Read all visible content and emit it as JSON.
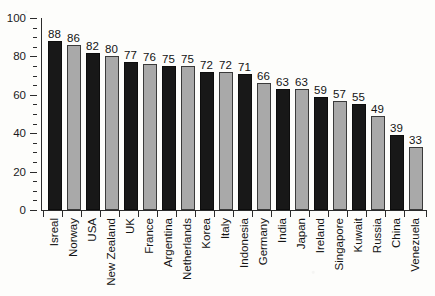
{
  "chart_data": {
    "type": "bar",
    "title": "",
    "subtitle": "",
    "xlabel": "",
    "ylabel": "",
    "ylim": [
      0,
      100
    ],
    "y_major_ticks": [
      0,
      20,
      40,
      60,
      80,
      100
    ],
    "y_minor_tick_step": 5,
    "grid": false,
    "legend": null,
    "bar_colors": {
      "dark": "#181818",
      "light": "#a9a9a9",
      "pattern": "alternating dark/light by index"
    },
    "value_labels_shown": true,
    "categories": [
      "Isreal",
      "Norway",
      "USA",
      "New Zealand",
      "UK",
      "France",
      "Argentina",
      "Netherlands",
      "Korea",
      "Italy",
      "Indonesia",
      "Germany",
      "India",
      "Japan",
      "Ireland",
      "Singapore",
      "Kuwait",
      "Russia",
      "China",
      "Venezuela"
    ],
    "values": [
      88,
      86,
      82,
      80,
      77,
      76,
      75,
      75,
      72,
      72,
      71,
      66,
      63,
      63,
      59,
      57,
      55,
      49,
      39,
      33
    ],
    "bars": [
      {
        "category": "Isreal",
        "value": 88,
        "shade": "dark"
      },
      {
        "category": "Norway",
        "value": 86,
        "shade": "light"
      },
      {
        "category": "USA",
        "value": 82,
        "shade": "dark"
      },
      {
        "category": "New Zealand",
        "value": 80,
        "shade": "light"
      },
      {
        "category": "UK",
        "value": 77,
        "shade": "dark"
      },
      {
        "category": "France",
        "value": 76,
        "shade": "light"
      },
      {
        "category": "Argentina",
        "value": 75,
        "shade": "dark"
      },
      {
        "category": "Netherlands",
        "value": 75,
        "shade": "light"
      },
      {
        "category": "Korea",
        "value": 72,
        "shade": "dark"
      },
      {
        "category": "Italy",
        "value": 72,
        "shade": "light"
      },
      {
        "category": "Indonesia",
        "value": 71,
        "shade": "dark"
      },
      {
        "category": "Germany",
        "value": 66,
        "shade": "light"
      },
      {
        "category": "India",
        "value": 63,
        "shade": "dark"
      },
      {
        "category": "Japan",
        "value": 63,
        "shade": "light"
      },
      {
        "category": "Ireland",
        "value": 59,
        "shade": "dark"
      },
      {
        "category": "Singapore",
        "value": 57,
        "shade": "light"
      },
      {
        "category": "Kuwait",
        "value": 55,
        "shade": "dark"
      },
      {
        "category": "Russia",
        "value": 49,
        "shade": "light"
      },
      {
        "category": "China",
        "value": 39,
        "shade": "dark"
      },
      {
        "category": "Venezuela",
        "value": 33,
        "shade": "light"
      }
    ]
  }
}
